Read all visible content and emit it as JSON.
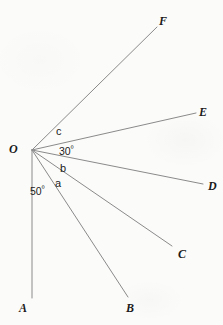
{
  "figure": {
    "background_color": "#fbfbfa",
    "line_color": "#8a8a8a",
    "text_color": "#1b1b1b"
  },
  "vertex": {
    "name": "O",
    "label": "O",
    "x": 32,
    "y": 150,
    "label_x": 9,
    "label_y": 143
  },
  "rays": [
    {
      "id": "OA",
      "label": "A",
      "end_x": 32,
      "end_y": 298,
      "label_x": 19,
      "label_y": 302,
      "angle_deg": 270
    },
    {
      "id": "OB",
      "label": "B",
      "end_x": 128,
      "end_y": 297,
      "label_x": 126,
      "label_y": 302,
      "angle_deg": 303
    },
    {
      "id": "OC",
      "label": "C",
      "end_x": 172,
      "end_y": 246,
      "label_x": 178,
      "label_y": 248,
      "angle_deg": 325
    },
    {
      "id": "OD",
      "label": "D",
      "end_x": 203,
      "end_y": 184,
      "label_x": 208,
      "label_y": 180,
      "angle_deg": 348
    },
    {
      "id": "OE",
      "label": "E",
      "end_x": 196,
      "end_y": 113,
      "label_x": 199,
      "label_y": 106,
      "angle_deg": 13
    },
    {
      "id": "OF",
      "label": "F",
      "end_x": 157,
      "end_y": 27,
      "label_x": 159,
      "label_y": 15,
      "angle_deg": 45
    }
  ],
  "angle_labels": [
    {
      "id": "angle-AOB",
      "text": "50",
      "degree_symbol": "º",
      "has_degree": true,
      "between": "OA-OB",
      "x": 30,
      "y": 186
    },
    {
      "id": "angle-BOC",
      "text": "a",
      "has_degree": false,
      "between": "OB-OC",
      "x": 55,
      "y": 178
    },
    {
      "id": "angle-COD",
      "text": "b",
      "has_degree": false,
      "between": "OC-OD",
      "x": 60,
      "y": 163
    },
    {
      "id": "angle-DOE",
      "text": "30",
      "degree_symbol": "º",
      "has_degree": true,
      "between": "OD-OE",
      "x": 59,
      "y": 146
    },
    {
      "id": "angle-EOF",
      "text": "c",
      "has_degree": false,
      "between": "OE-OF",
      "x": 56,
      "y": 126
    }
  ],
  "chart_data": {
    "type": "diagram",
    "subtype": "angle-fan",
    "vertex": "O",
    "rays": [
      "OA",
      "OB",
      "OC",
      "OD",
      "OE",
      "OF"
    ],
    "ray_endpoints": [
      "A",
      "B",
      "C",
      "D",
      "E",
      "F"
    ],
    "known_angles": [
      {
        "angle": "AOB",
        "value": 50,
        "unit": "degrees"
      },
      {
        "angle": "DOE",
        "value": 30,
        "unit": "degrees"
      }
    ],
    "unknown_angles": [
      {
        "angle": "BOC",
        "variable": "a"
      },
      {
        "angle": "COD",
        "variable": "b"
      },
      {
        "angle": "EOF",
        "variable": "c"
      }
    ]
  }
}
